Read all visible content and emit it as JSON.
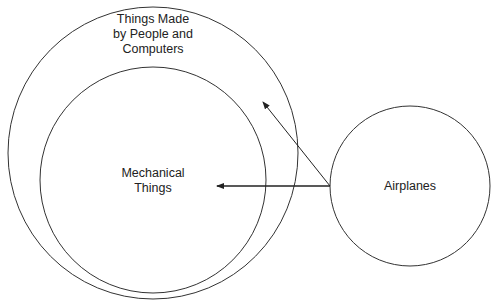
{
  "diagram": {
    "sets": [
      {
        "id": "outer",
        "label_lines": [
          "Things Made",
          "by People and",
          "Computers"
        ]
      },
      {
        "id": "inner",
        "label_lines": [
          "Mechanical",
          "Things"
        ]
      },
      {
        "id": "airplanes",
        "label_lines": [
          "Airplanes"
        ]
      }
    ],
    "stroke_color": "#333333",
    "arrows": [
      {
        "from": "airplanes",
        "to": "inner"
      },
      {
        "from": "airplanes",
        "to": "outer"
      }
    ]
  }
}
